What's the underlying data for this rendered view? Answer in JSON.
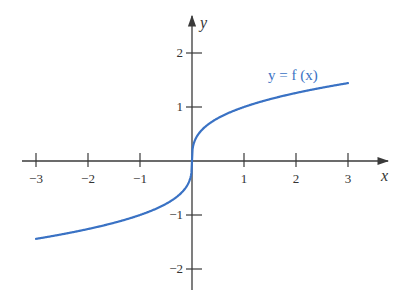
{
  "chart_data": {
    "type": "line",
    "title": "",
    "xlabel": "x",
    "ylabel": "y",
    "xlim": [
      -3,
      3
    ],
    "ylim": [
      -2,
      2
    ],
    "grid": false,
    "x_ticks": [
      -3,
      -2,
      -1,
      1,
      2,
      3
    ],
    "x_tick_labels": [
      "−3",
      "−2",
      "−1",
      "1",
      "2",
      "3"
    ],
    "y_ticks": [
      -2,
      -1,
      1,
      2
    ],
    "y_tick_labels": [
      "−2",
      "−1",
      "1",
      "2"
    ],
    "series": [
      {
        "name": "y = f (x)",
        "function": "cube root",
        "color": "#3a72c4",
        "x": [
          -3,
          -2.5,
          -2,
          -1.5,
          -1,
          -0.5,
          -0.2,
          -0.05,
          0,
          0.05,
          0.2,
          0.5,
          1,
          1.5,
          2,
          2.5,
          3
        ],
        "y": [
          -1.44,
          -1.36,
          -1.26,
          -1.14,
          -1.0,
          -0.79,
          -0.58,
          -0.37,
          0,
          0.37,
          0.58,
          0.79,
          1.0,
          1.14,
          1.26,
          1.36,
          1.44
        ]
      }
    ],
    "annotations": [
      {
        "text": "y = f (x)",
        "x": 2.2,
        "y": 1.75
      }
    ]
  },
  "labels": {
    "x_axis": "x",
    "y_axis": "y",
    "curve": "y = f (x)"
  },
  "colors": {
    "curve": "#3a72c4",
    "axis": "#3a3a3a"
  }
}
